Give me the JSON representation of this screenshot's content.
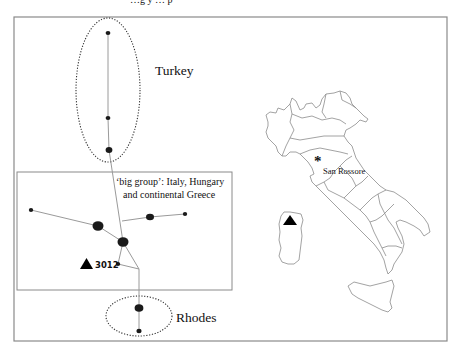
{
  "figure": {
    "caption_cropped": "…g y … p",
    "frame": {
      "x": 14,
      "y": 17,
      "w": 433,
      "h": 324,
      "stroke": "#8a8a8a"
    },
    "colors": {
      "node": "#1a1a1a",
      "edge": "#9a9a9a",
      "ellipse": "#333333",
      "map_line": "#8c8c8c",
      "frame": "#8a8a8a"
    }
  },
  "network": {
    "groups": [
      {
        "id": "turkey",
        "label": "Turkey",
        "label_x": 155,
        "label_y": 75,
        "ellipse": {
          "cx": 108,
          "cy": 90,
          "rx": 32,
          "ry": 72
        }
      },
      {
        "id": "big-group",
        "label_line1": "‘big group’: Italy, Hungary",
        "label_line2": "and continental Greece",
        "box": {
          "x": 17,
          "y": 172,
          "w": 215,
          "h": 118
        }
      },
      {
        "id": "rhodes",
        "label": "Rhodes",
        "label_x": 176,
        "label_y": 322,
        "ellipse": {
          "cx": 139,
          "cy": 316,
          "rx": 33,
          "ry": 20
        }
      }
    ],
    "nodes": [
      {
        "id": "t1",
        "x": 108,
        "y": 33,
        "r": 2.2
      },
      {
        "id": "t2",
        "x": 108,
        "y": 118,
        "r": 2.2
      },
      {
        "id": "t3",
        "x": 109,
        "y": 150,
        "r": 3.2
      },
      {
        "id": "b1",
        "x": 31,
        "y": 210,
        "r": 2
      },
      {
        "id": "b2",
        "x": 98,
        "y": 226,
        "r": 5
      },
      {
        "id": "b3",
        "x": 123,
        "y": 242,
        "r": 5
      },
      {
        "id": "b4",
        "x": 150,
        "y": 217,
        "r": 3.8
      },
      {
        "id": "b5",
        "x": 185,
        "y": 214,
        "r": 2
      },
      {
        "id": "b6",
        "x": 118,
        "y": 264,
        "r": 2
      },
      {
        "id": "r1",
        "x": 139,
        "y": 308,
        "r": 4.2
      },
      {
        "id": "r2",
        "x": 139,
        "y": 331,
        "r": 2.4
      }
    ],
    "highlight": {
      "label": "3012",
      "marker": "triangle",
      "node": "b6"
    }
  },
  "map": {
    "title": "Italy",
    "site_label": "San Rossore",
    "site_marker": "asterisk",
    "sardinia_marker": "triangle"
  }
}
